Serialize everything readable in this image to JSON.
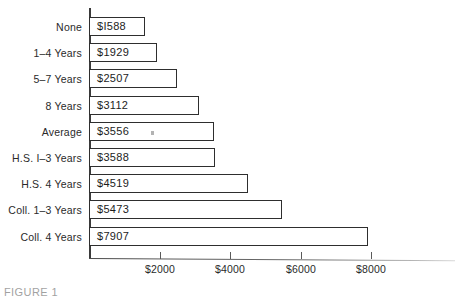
{
  "chart_data": {
    "type": "bar",
    "orientation": "horizontal",
    "title": "",
    "xlabel": "",
    "ylabel": "",
    "xlim": [
      0,
      9000
    ],
    "grid": false,
    "legend": null,
    "categories": [
      "None",
      "1–4 Years",
      "5–7 Years",
      "8 Years",
      "Average",
      "H.S. I–3 Years",
      "H.S. 4 Years",
      "Coll. 1–3 Years",
      "Coll. 4 Years"
    ],
    "values": [
      1588,
      1929,
      2507,
      3112,
      3556,
      3588,
      4519,
      5473,
      7907
    ],
    "value_labels": [
      "$I588",
      "$1929",
      "$2507",
      "$3112",
      "$3556",
      "$3588",
      "$4519",
      "$5473",
      "$7907"
    ],
    "xticks": [
      2000,
      4000,
      6000,
      8000
    ],
    "xtick_labels": [
      "$2000",
      "$4000",
      "$6000",
      "$8000"
    ],
    "bar_fill_color": "#ffffff",
    "bar_edge_color": "#2e2e2e",
    "axis_color": "#3a3a3a",
    "text_color": "#2a2a2a"
  },
  "caption": {
    "text": "FIGURE 1"
  }
}
